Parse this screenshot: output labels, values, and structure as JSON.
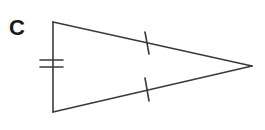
{
  "figure": {
    "label": "C",
    "shape": "isosceles triangle",
    "stroke_color": "#3a3a3a",
    "vertices": {
      "top_left": [
        53,
        22
      ],
      "bottom_left": [
        53,
        112
      ],
      "apex": [
        252,
        66
      ]
    },
    "marks": {
      "left_side": "double tick",
      "top_side": "single tick",
      "bottom_side": "single tick"
    }
  }
}
